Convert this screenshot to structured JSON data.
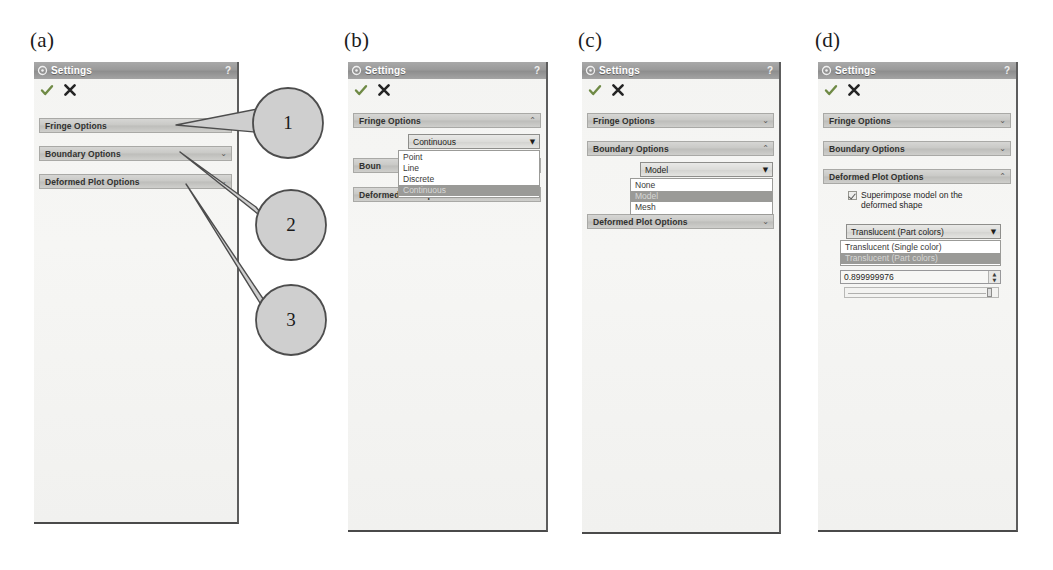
{
  "figure": {
    "labels": [
      "(a)",
      "(b)",
      "(c)",
      "(d)"
    ]
  },
  "window": {
    "title": "Settings",
    "help_label": "?",
    "accept_icon": "check-icon",
    "cancel_icon": "close-icon",
    "app_icon": "settings-icon"
  },
  "sections": {
    "fringe": "Fringe Options",
    "boundary": "Boundary Options",
    "deformed": "Deformed Plot Options"
  },
  "chevrons": {
    "collapsed": "⌄",
    "expanded": "⌃"
  },
  "panel_a": {
    "label": "(a)",
    "sections": [
      {
        "title": "Fringe Options",
        "state": "collapsed"
      },
      {
        "title": "Boundary Options",
        "state": "collapsed"
      },
      {
        "title": "Deformed Plot Options",
        "state": "collapsed"
      }
    ]
  },
  "panel_b": {
    "label": "(b)",
    "fringe_title": "Fringe Options",
    "deformed_title": "Deformed Plot Options",
    "boundary_clipped": "Boun",
    "combo_value": "Continuous",
    "combo_arrow": "▼",
    "options": [
      "Point",
      "Line",
      "Discrete",
      "Continuous"
    ],
    "selected": "Continuous"
  },
  "panel_c": {
    "label": "(c)",
    "fringe_title": "Fringe Options",
    "boundary_title": "Boundary Options",
    "deformed_title": "Deformed Plot Options",
    "combo_value": "Model",
    "combo_arrow": "▼",
    "options": [
      "None",
      "Model",
      "Mesh"
    ],
    "selected": "Model"
  },
  "panel_d": {
    "label": "(d)",
    "fringe_title": "Fringe Options",
    "boundary_title": "Boundary Options",
    "deformed_title": "Deformed Plot Options",
    "checkbox_label": "Superimpose model on the deformed shape",
    "checkbox_checked": true,
    "combo_value": "Translucent (Part colors)",
    "combo_arrow": "▼",
    "options": [
      "Translucent (Single color)",
      "Translucent (Part colors)"
    ],
    "selected": "Translucent (Part colors)",
    "spin_value": "0.899999976",
    "spin_up": "▲",
    "spin_down": "▼"
  },
  "callouts": [
    {
      "number": "1",
      "target": "Fringe Options"
    },
    {
      "number": "2",
      "target": "Boundary Options"
    },
    {
      "number": "3",
      "target": "Deformed Plot Options"
    }
  ],
  "colors": {
    "titlebar": "#9a9a9a",
    "section_header": "#c9c9c6",
    "panel_background": "#f2f2f0",
    "highlight": "#9a9a97",
    "check_green": "#6f8a45",
    "callout_fill": "#cfcfcf"
  }
}
